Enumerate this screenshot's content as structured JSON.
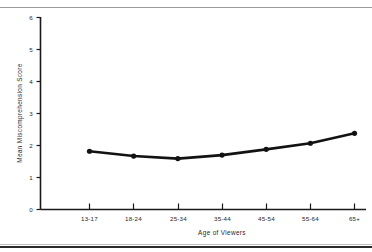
{
  "chart_data": {
    "type": "line",
    "title": "",
    "xlabel": "Age of Viewers",
    "ylabel": "Mean Miscomprehension Score",
    "categories": [
      "13-17",
      "18-24",
      "25-34",
      "35-44",
      "45-54",
      "55-64",
      "65+"
    ],
    "values": [
      1.82,
      1.67,
      1.59,
      1.7,
      1.88,
      2.07,
      2.38
    ],
    "series": [
      {
        "name": "Mean Miscomprehension Score",
        "values": [
          1.82,
          1.67,
          1.59,
          1.7,
          1.88,
          2.07,
          2.38
        ]
      }
    ],
    "ylim": [
      0,
      6
    ],
    "y_ticks": [
      "0",
      "1",
      "2",
      "3",
      "4",
      "5",
      "6"
    ],
    "grid": false,
    "legend": "none",
    "marker": "filled-circle",
    "line_color": "#121212"
  },
  "figure": {
    "x_axis_title": "Age of Viewers",
    "y_axis_title": "Mean Miscomprehension Score",
    "x_tick_labels": [
      "13-17",
      "18-24",
      "25-34",
      "35-44",
      "45-54",
      "55-64",
      "65+"
    ],
    "y_tick_labels": [
      "0",
      "1",
      "2",
      "3",
      "4",
      "5",
      "6"
    ]
  }
}
